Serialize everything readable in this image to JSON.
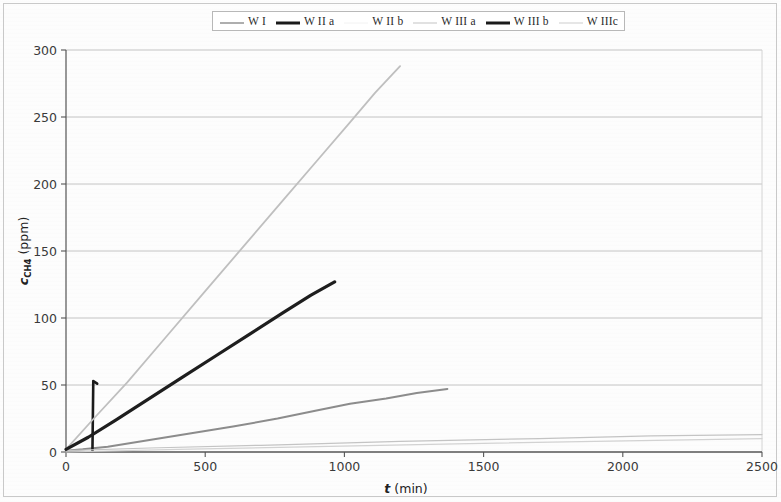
{
  "chart_data": {
    "type": "line",
    "title": "",
    "xlabel": "t (min)",
    "ylabel": "c_CH4 (ppm)",
    "ylabel_base": "c",
    "ylabel_sub": "CH4",
    "ylabel_unit": "(ppm)",
    "xlabel_italic": "t",
    "xlabel_unit": "(min)",
    "xlim": [
      0,
      2500
    ],
    "ylim": [
      0,
      300
    ],
    "xticks": [
      0,
      500,
      1000,
      1500,
      2000,
      2500
    ],
    "yticks": [
      0,
      50,
      100,
      150,
      200,
      250,
      300
    ],
    "xtick_labels": [
      "0",
      "500",
      "1000",
      "1500",
      "2000",
      "2500"
    ],
    "ytick_labels": [
      "0",
      "50",
      "100",
      "150",
      "200",
      "250",
      "300"
    ],
    "grid": "horizontal",
    "legend_position": "top-center",
    "series": [
      {
        "name": "W I",
        "color": "#8c8c8c",
        "width": 2.0,
        "style": "solid",
        "points": [
          [
            0,
            1
          ],
          [
            60,
            2
          ],
          [
            150,
            4
          ],
          [
            300,
            9
          ],
          [
            450,
            14
          ],
          [
            600,
            19
          ],
          [
            760,
            25
          ],
          [
            900,
            31
          ],
          [
            1020,
            36
          ],
          [
            1150,
            40
          ],
          [
            1260,
            44
          ],
          [
            1370,
            47
          ]
        ]
      },
      {
        "name": "W II a",
        "color": "#1a1a1a",
        "width": 2.6,
        "style": "solid",
        "points": [
          [
            95,
            1
          ],
          [
            98,
            53
          ],
          [
            112,
            51
          ]
        ]
      },
      {
        "name": "W II b",
        "color": "#c4c4c4",
        "width": 1.2,
        "style": "solid",
        "points": [
          [
            0,
            1
          ],
          [
            300,
            3
          ],
          [
            700,
            5
          ],
          [
            1200,
            8
          ],
          [
            1700,
            10
          ],
          [
            2100,
            12
          ],
          [
            2500,
            13
          ]
        ]
      },
      {
        "name": "W III a",
        "color": "#bfbfbf",
        "width": 1.8,
        "style": "solid",
        "points": [
          [
            0,
            2
          ],
          [
            100,
            25
          ],
          [
            220,
            52
          ],
          [
            360,
            86
          ],
          [
            500,
            120
          ],
          [
            640,
            154
          ],
          [
            780,
            188
          ],
          [
            900,
            217
          ],
          [
            1020,
            246
          ],
          [
            1110,
            268
          ],
          [
            1200,
            288
          ]
        ]
      },
      {
        "name": "W III b",
        "color": "#1e1e1e",
        "width": 3.2,
        "style": "solid",
        "points": [
          [
            0,
            2
          ],
          [
            80,
            11
          ],
          [
            180,
            24
          ],
          [
            300,
            40
          ],
          [
            420,
            56
          ],
          [
            540,
            72
          ],
          [
            660,
            88
          ],
          [
            780,
            104
          ],
          [
            880,
            117
          ],
          [
            965,
            127
          ]
        ]
      },
      {
        "name": "W IIIc",
        "color": "#d2d2d2",
        "width": 1.2,
        "style": "solid",
        "points": [
          [
            0,
            0
          ],
          [
            400,
            2
          ],
          [
            900,
            4
          ],
          [
            1400,
            6
          ],
          [
            1900,
            8
          ],
          [
            2500,
            10
          ]
        ]
      }
    ]
  },
  "legend": {
    "items": [
      {
        "label": "W I",
        "color": "#9a9a9a",
        "width": 1.6
      },
      {
        "label": "W II a",
        "color": "#1a1a1a",
        "width": 3.0
      },
      {
        "label": "W II b",
        "color": "#f2f2f2",
        "width": 1.0
      },
      {
        "label": "W III a",
        "color": "#cdcdcd",
        "width": 1.2
      },
      {
        "label": "W III b",
        "color": "#1a1a1a",
        "width": 3.0
      },
      {
        "label": "W IIIc",
        "color": "#cdcdcd",
        "width": 1.0
      }
    ]
  },
  "colors": {
    "frame": "#c9c9c9",
    "axis": "#555555",
    "grid": "#b4b4b4",
    "background": "#fdfdfd"
  }
}
